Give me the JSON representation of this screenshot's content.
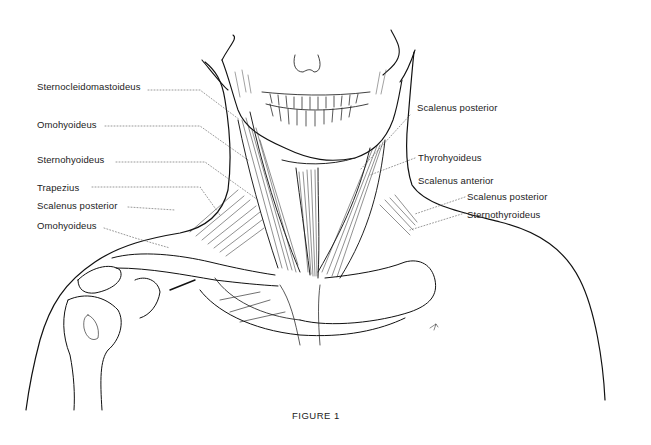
{
  "figure": {
    "caption": "FIGURE 1",
    "labels_left": [
      {
        "text": "Sternocleidomastoideus",
        "x": 37,
        "y": 81
      },
      {
        "text": "Omohyoideus",
        "x": 37,
        "y": 119
      },
      {
        "text": "Sternohyoideus",
        "x": 37,
        "y": 154
      },
      {
        "text": "Trapezius",
        "x": 37,
        "y": 182
      },
      {
        "text": "Scalenus posterior",
        "x": 37,
        "y": 200
      },
      {
        "text": "Omohyoideus",
        "x": 37,
        "y": 220
      }
    ],
    "labels_right": [
      {
        "text": "Scalenus posterior",
        "x": 417,
        "y": 102
      },
      {
        "text": "Thyrohyoideus",
        "x": 418,
        "y": 152
      },
      {
        "text": "Scalenus anterior",
        "x": 418,
        "y": 175
      },
      {
        "text": "Scalenus posterior",
        "x": 467,
        "y": 191
      },
      {
        "text": "Sternothyroideus",
        "x": 467,
        "y": 209
      }
    ]
  }
}
